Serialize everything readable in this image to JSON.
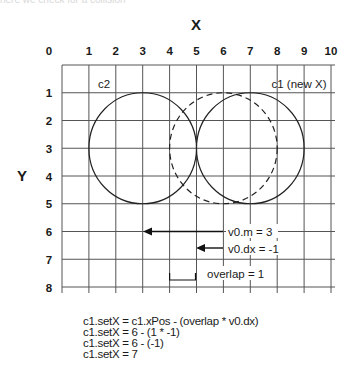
{
  "caption_cut": "here we check for a collision",
  "axes": {
    "x_title": "X",
    "y_title": "Y",
    "x_ticks": [
      "0",
      "1",
      "2",
      "3",
      "4",
      "5",
      "6",
      "7",
      "8",
      "9",
      "10"
    ],
    "y_ticks": [
      "1",
      "2",
      "3",
      "4",
      "5",
      "6",
      "7",
      "8"
    ]
  },
  "circles": [
    {
      "label": "c2",
      "cx": 3,
      "cy": 3,
      "r": 2,
      "style": "solid"
    },
    {
      "label": "c1 (new X)",
      "cx": 7,
      "cy": 3,
      "r": 2,
      "style": "solid"
    },
    {
      "label": "c1 (old X)",
      "cx": 6,
      "cy": 3,
      "r": 2,
      "style": "dashed"
    }
  ],
  "labels": {
    "c2": "c2",
    "c1": "c1 (new X)"
  },
  "annotations": {
    "v0m": "v0.m = 3",
    "v0dx": "v0.dx = -1",
    "overlap": "overlap = 1"
  },
  "vectors": [
    {
      "name": "v0.m",
      "from_x": 6,
      "to_x": 3,
      "y": 6
    },
    {
      "name": "v0.dx",
      "from_x": 6,
      "to_x": 5,
      "y": 6.6
    }
  ],
  "overlap_bracket": {
    "from_x": 4,
    "to_x": 5,
    "y": 7.75
  },
  "code_lines": [
    "c1.setX = c1.xPos - (overlap * v0.dx)",
    "c1.setX = 6 - (1 * -1)",
    "c1.setX = 6 - (-1)",
    "c1.setX = 7"
  ]
}
